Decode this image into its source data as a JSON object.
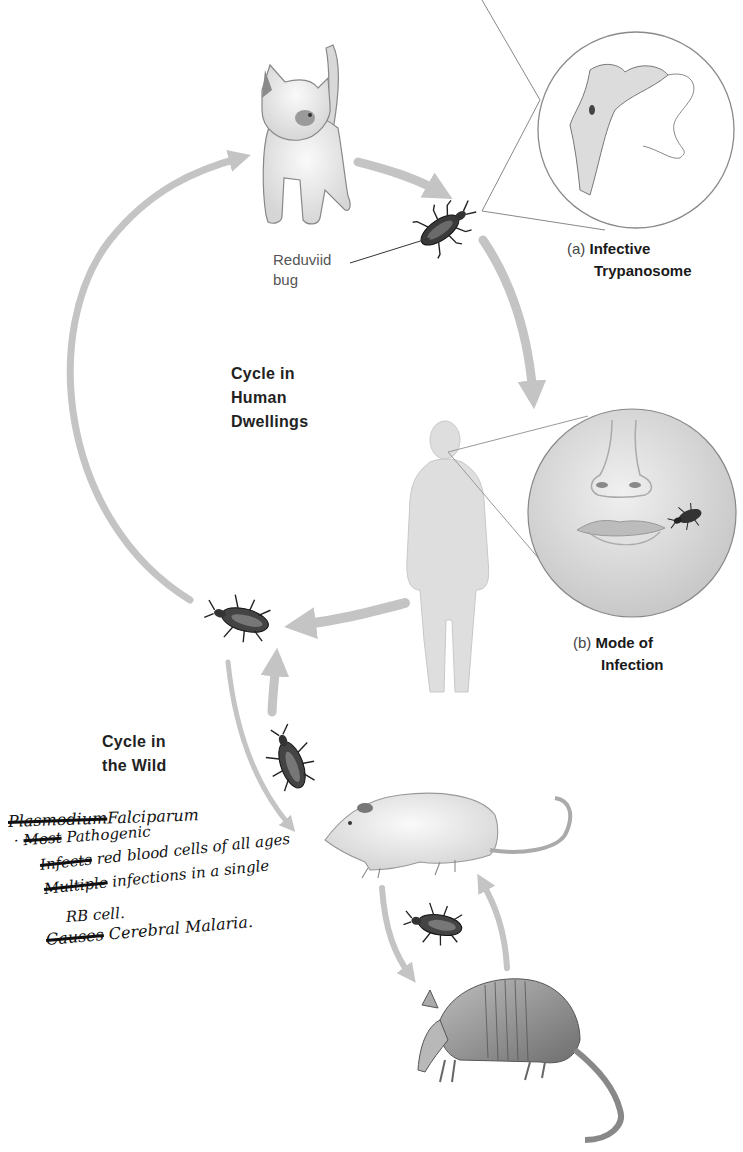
{
  "figure": {
    "labels": {
      "reduviid": {
        "line1": "Reduviid",
        "line2": "bug"
      },
      "panel_a": {
        "marker": "(a)",
        "line1": "Infective",
        "line2": "Trypanosome"
      },
      "panel_b": {
        "marker": "(b)",
        "line1": "Mode of",
        "line2": "Infection"
      },
      "cycle_human": {
        "line1": "Cycle in",
        "line2": "Human",
        "line3": "Dwellings"
      },
      "cycle_wild": {
        "line1": "Cycle in",
        "line2": "the Wild"
      }
    },
    "illustrations": [
      "kitten",
      "reduviid-bug",
      "trypanosome-inset",
      "human-silhouette",
      "face-inset-with-bug",
      "opossum",
      "armadillo"
    ],
    "colors": {
      "arrow": "#c4c4c4",
      "text": "#1a1a1a",
      "ink": "#111111",
      "inset_border": "#8a8a8a"
    }
  },
  "handwritten_note": {
    "title_struck": "Plasmodium",
    "title": "Falciparum",
    "lines": [
      {
        "struck": "Most",
        "text": "Pathogenic"
      },
      {
        "struck": "Infects",
        "text": "red blood cells of all ages"
      },
      {
        "struck": "Multiple",
        "text": "infections in a single"
      },
      {
        "struck": "",
        "text": "RB cell."
      },
      {
        "struck": "Causes",
        "text": "Cerebral Malaria."
      }
    ]
  }
}
